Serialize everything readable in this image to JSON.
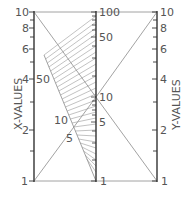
{
  "diagram": {
    "type": "alignment nomogram",
    "left_axis": {
      "title": "X-VALUES",
      "scale": "log",
      "range": [
        1,
        10
      ],
      "tick_labels": [
        "10",
        "8",
        "6",
        "4",
        "2",
        "1"
      ]
    },
    "center_axis": {
      "scale": "log",
      "range": [
        1,
        100
      ],
      "tick_labels": [
        "100",
        "50",
        "10",
        "5",
        "1"
      ]
    },
    "right_axis": {
      "title": "Y-VALUES",
      "scale": "log",
      "range": [
        1,
        10
      ],
      "tick_labels": [
        "10",
        "8",
        "6",
        "4",
        "2",
        "1"
      ]
    },
    "curved_scale": {
      "tick_labels": [
        "50",
        "10",
        "5"
      ]
    },
    "colors": {
      "axis": "#333333",
      "line": "#777777",
      "hatch": "#888888",
      "text": "#555555"
    }
  }
}
